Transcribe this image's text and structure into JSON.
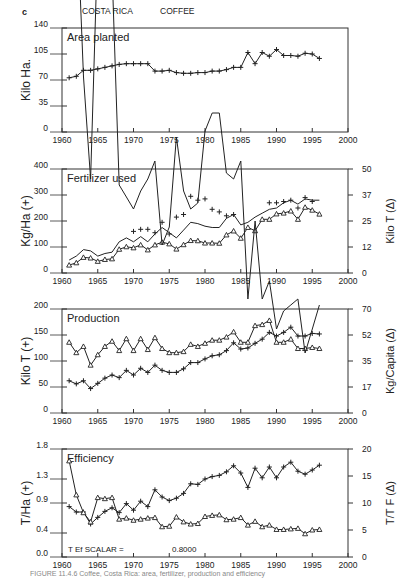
{
  "figure": {
    "panel_letter": "c",
    "country": "COSTA RICA",
    "crop": "COFFEE",
    "caption": "FIGURE 11.4.6 Coffee, Costa Rica: area, fertilizer, production and efficiency"
  },
  "chart_data": [
    {
      "type": "line",
      "title": "Area planted",
      "xlabel": "",
      "ylabel": "Kilo Ha.",
      "xlim": [
        1960,
        2000
      ],
      "ylim": [
        0,
        140
      ],
      "xticks": [
        1960,
        1965,
        1970,
        1975,
        1980,
        1985,
        1990,
        1995,
        2000
      ],
      "yticks": [
        0,
        35,
        70,
        105,
        140
      ],
      "x": [
        1961,
        1962,
        1963,
        1964,
        1965,
        1966,
        1967,
        1968,
        1969,
        1970,
        1971,
        1972,
        1973,
        1974,
        1975,
        1976,
        1977,
        1978,
        1979,
        1980,
        1981,
        1982,
        1983,
        1984,
        1985,
        1986,
        1987,
        1988,
        1989,
        1990,
        1991,
        1992,
        1993,
        1994,
        1995,
        1996
      ],
      "series": [
        {
          "name": "Area planted (+)",
          "marker": "+",
          "values": [
            73,
            75,
            83,
            83,
            85,
            87,
            89,
            91,
            92,
            92,
            92,
            92,
            82,
            82,
            83,
            80,
            79,
            79,
            80,
            80,
            82,
            82,
            84,
            87,
            87,
            107,
            92,
            107,
            102,
            111,
            103,
            103,
            102,
            106,
            105,
            99
          ]
        }
      ]
    },
    {
      "type": "line",
      "title": "Fertilizer used",
      "ylabel": "Kg/Ha (+)",
      "ylabel_right": "Kilo T (Δ)",
      "xlim": [
        1960,
        2000
      ],
      "ylim": [
        0,
        400
      ],
      "ylim_right": [
        0,
        50
      ],
      "xticks": [
        1960,
        1965,
        1970,
        1975,
        1980,
        1985,
        1990,
        1995,
        2000
      ],
      "yticks": [
        0,
        100,
        200,
        300,
        400
      ],
      "yticks_right": [
        0,
        12,
        25,
        37,
        50
      ],
      "x": [
        1961,
        1962,
        1963,
        1964,
        1965,
        1966,
        1967,
        1968,
        1969,
        1970,
        1971,
        1972,
        1973,
        1974,
        1975,
        1976,
        1977,
        1978,
        1979,
        1980,
        1981,
        1982,
        1983,
        1984,
        1985,
        1986,
        1987,
        1988,
        1989,
        1990,
        1991,
        1992,
        1993,
        1994,
        1995,
        1996
      ],
      "series": [
        {
          "name": "Kg/Ha (+)",
          "marker": "+",
          "style": "points",
          "values": [
            null,
            null,
            null,
            null,
            null,
            null,
            null,
            null,
            null,
            160,
            168,
            168,
            155,
            195,
            150,
            215,
            225,
            295,
            280,
            285,
            245,
            235,
            220,
            225,
            null,
            null,
            null,
            null,
            270,
            270,
            275,
            280,
            250,
            290,
            275,
            null
          ]
        },
        {
          "name": "Kg/Ha smoothed",
          "marker": "none",
          "style": "line",
          "values": [
            50,
            65,
            90,
            85,
            65,
            75,
            80,
            120,
            135,
            120,
            140,
            120,
            150,
            175,
            155,
            135,
            165,
            195,
            190,
            180,
            175,
            175,
            210,
            225,
            185,
            195,
            215,
            230,
            245,
            250,
            270,
            280,
            265,
            285,
            280,
            280
          ]
        },
        {
          "name": "Kilo T (Δ)",
          "marker": "triangle",
          "axis": "right",
          "values": [
            3.8,
            4.9,
            7.5,
            7.2,
            5.6,
            6.5,
            6.8,
            11.4,
            12.6,
            12.1,
            13.5,
            11.1,
            13.5,
            14.8,
            14.0,
            11.5,
            13.6,
            15.6,
            15.5,
            14.4,
            14.4,
            14.3,
            18.3,
            20.2,
            16.7,
            21.9,
            20.3,
            25.8,
            25.8,
            28.4,
            28.8,
            29.8,
            25.8,
            31.6,
            30.2,
            28.3
          ]
        }
      ]
    },
    {
      "type": "line",
      "title": "Production",
      "ylabel": "Kilo T (+)",
      "ylabel_right": "Kg/Capita (Δ)",
      "xlim": [
        1960,
        2000
      ],
      "ylim": [
        0,
        200
      ],
      "ylim_right": [
        0,
        70
      ],
      "xticks": [
        1960,
        1965,
        1970,
        1975,
        1980,
        1985,
        1990,
        1995,
        2000
      ],
      "yticks": [
        0,
        50,
        100,
        150,
        200
      ],
      "yticks_right": [
        0,
        17,
        35,
        52,
        70
      ],
      "x": [
        1961,
        1962,
        1963,
        1964,
        1965,
        1966,
        1967,
        1968,
        1969,
        1970,
        1971,
        1972,
        1973,
        1974,
        1975,
        1976,
        1977,
        1978,
        1979,
        1980,
        1981,
        1982,
        1983,
        1984,
        1985,
        1986,
        1987,
        1988,
        1989,
        1990,
        1991,
        1992,
        1993,
        1994,
        1995,
        1996
      ],
      "series": [
        {
          "name": "Kilo T (+)",
          "marker": "+",
          "values": [
            62,
            56,
            62,
            47,
            57,
            67,
            73,
            68,
            82,
            73,
            86,
            78,
            92,
            82,
            78,
            78,
            85,
            97,
            97,
            104,
            110,
            112,
            120,
            135,
            123,
            125,
            134,
            142,
            155,
            148,
            155,
            165,
            148,
            148,
            153,
            152
          ]
        },
        {
          "name": "Kg/Capita (Δ)",
          "marker": "triangle",
          "axis": "right",
          "values": [
            47.6,
            40.6,
            44.8,
            32.2,
            39.2,
            44.8,
            48.3,
            42.0,
            50.0,
            42.0,
            50.0,
            42.7,
            50.7,
            43.4,
            40.6,
            40.6,
            41.3,
            46.2,
            44.8,
            46.9,
            49.0,
            49.0,
            51.1,
            54.6,
            47.6,
            47.6,
            58.8,
            59.5,
            62.3,
            47.6,
            47.6,
            49.7,
            43.4,
            43.4,
            44.1,
            43.4
          ]
        }
      ]
    },
    {
      "type": "line",
      "title": "Efficiency",
      "ylabel": "T/Ha (+)",
      "ylabel_right": "T/T F (Δ)",
      "annotation": {
        "label": "T Ef SCALAR =",
        "value": "0.8000"
      },
      "xlim": [
        1960,
        2000
      ],
      "ylim": [
        0.0,
        1.8
      ],
      "ylim_right": [
        0,
        20
      ],
      "xticks": [
        1960,
        1965,
        1970,
        1975,
        1980,
        1985,
        1990,
        1995,
        2000
      ],
      "yticks": [
        0.0,
        0.4,
        0.9,
        1.3,
        1.8
      ],
      "yticks_right": [
        0,
        5,
        10,
        15,
        20
      ],
      "x": [
        1961,
        1962,
        1963,
        1964,
        1965,
        1966,
        1967,
        1968,
        1969,
        1970,
        1971,
        1972,
        1973,
        1974,
        1975,
        1976,
        1977,
        1978,
        1979,
        1980,
        1981,
        1982,
        1983,
        1984,
        1985,
        1986,
        1987,
        1988,
        1989,
        1990,
        1991,
        1992,
        1993,
        1994,
        1995,
        1996
      ],
      "series": [
        {
          "name": "T/Ha (+)",
          "marker": "+",
          "values": [
            0.84,
            0.75,
            0.75,
            0.55,
            0.66,
            0.76,
            0.82,
            0.74,
            0.89,
            0.78,
            0.93,
            0.84,
            1.12,
            1.0,
            0.94,
            0.98,
            1.06,
            1.22,
            1.21,
            1.3,
            1.34,
            1.36,
            1.42,
            1.52,
            1.4,
            1.16,
            1.48,
            1.32,
            1.5,
            1.32,
            1.5,
            1.58,
            1.43,
            1.38,
            1.45,
            1.53
          ]
        },
        {
          "name": "T/T F (Δ)",
          "marker": "triangle",
          "axis": "right",
          "values": [
            17.8,
            11.5,
            8.2,
            6.5,
            11.0,
            10.8,
            11.0,
            7.0,
            7.2,
            6.8,
            7.0,
            7.2,
            7.3,
            5.6,
            5.7,
            7.4,
            6.5,
            6.1,
            6.2,
            7.5,
            7.7,
            7.8,
            6.9,
            7.0,
            7.3,
            5.9,
            6.6,
            5.6,
            5.9,
            5.1,
            5.1,
            5.2,
            5.3,
            4.3,
            5.0,
            5.1
          ]
        },
        {
          "name": "Scaled efficiency",
          "marker": "none",
          "style": "line",
          "values": [
            17.0,
            11.0,
            8.0,
            6.3,
            10.3,
            10.0,
            9.8,
            6.2,
            6.0,
            5.8,
            6.1,
            6.3,
            6.6,
            5.2,
            5.5,
            7.0,
            6.1,
            5.8,
            5.9,
            7.1,
            7.4,
            7.4,
            6.4,
            6.3,
            6.6,
            4.3,
            5.6,
            4.3,
            4.6,
            3.8,
            4.1,
            4.2,
            4.3,
            3.4,
            3.8,
            4.2
          ]
        }
      ]
    }
  ]
}
